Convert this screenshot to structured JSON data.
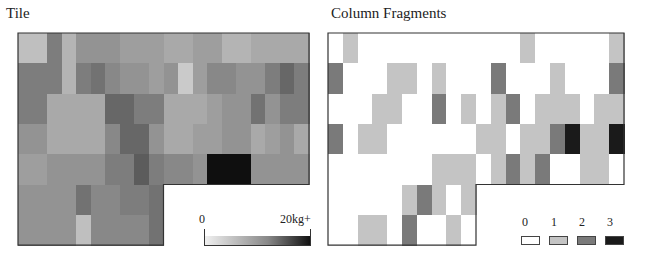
{
  "left_title": "Tile",
  "right_title": "Column Fragments",
  "left_legend": {
    "min_label": "0",
    "max_label": "20kg+"
  },
  "right_legend": {
    "labels": [
      "0",
      "1",
      "2",
      "3"
    ],
    "colors": [
      "#ffffff",
      "#c4c4c4",
      "#7a7a7a",
      "#1a1a1a"
    ]
  },
  "chart_data": [
    {
      "type": "heatmap",
      "title": "Tile",
      "shape": "L-shaped grid: 20 columns x 7 rows; rows 6-7 only columns 0-9",
      "colorbar": {
        "min": 0,
        "max": 20,
        "min_label": "0",
        "max_label": "20kg+",
        "colormap": "white-to-black"
      },
      "rows": [
        [
          4,
          4,
          10,
          5,
          8,
          8,
          8,
          7,
          7,
          7,
          6,
          6,
          7,
          7,
          5,
          5,
          6,
          6,
          6,
          6
        ],
        [
          10,
          10,
          10,
          5,
          10,
          11,
          9,
          8,
          8,
          7,
          8,
          3,
          7,
          9,
          9,
          8,
          8,
          10,
          12,
          10
        ],
        [
          10,
          10,
          6,
          6,
          6,
          6,
          12,
          12,
          10,
          10,
          6,
          6,
          6,
          7,
          8,
          8,
          11,
          8,
          10,
          10
        ],
        [
          8,
          8,
          6,
          6,
          6,
          6,
          9,
          12,
          12,
          8,
          6,
          6,
          7,
          7,
          8,
          8,
          6,
          7,
          8,
          6
        ],
        [
          7,
          7,
          8,
          8,
          8,
          8,
          10,
          10,
          13,
          10,
          9,
          9,
          8,
          20,
          20,
          20,
          8,
          8,
          8,
          8
        ],
        [
          8,
          8,
          8,
          8,
          11,
          9,
          9,
          10,
          10,
          11
        ],
        [
          8,
          8,
          8,
          8,
          4,
          9,
          9,
          9,
          9,
          11
        ]
      ]
    },
    {
      "type": "heatmap",
      "title": "Column Fragments",
      "shape": "L-shaped grid: 20 columns x 7 rows; rows 6-7 only columns 0-9",
      "legend": {
        "categories": [
          0,
          1,
          2,
          3
        ],
        "labels": [
          "0",
          "1",
          "2",
          "3"
        ]
      },
      "rows": [
        [
          0,
          1,
          0,
          0,
          0,
          0,
          0,
          0,
          0,
          0,
          0,
          0,
          0,
          1,
          0,
          0,
          0,
          0,
          0,
          1
        ],
        [
          2,
          0,
          0,
          0,
          1,
          1,
          0,
          1,
          0,
          0,
          0,
          2,
          0,
          0,
          0,
          1,
          0,
          0,
          0,
          2
        ],
        [
          0,
          0,
          0,
          1,
          1,
          0,
          0,
          2,
          0,
          1,
          0,
          1,
          2,
          0,
          1,
          1,
          1,
          0,
          1,
          1
        ],
        [
          2,
          0,
          1,
          1,
          0,
          0,
          0,
          0,
          0,
          0,
          1,
          1,
          0,
          1,
          1,
          2,
          3,
          1,
          1,
          3
        ],
        [
          0,
          0,
          0,
          0,
          0,
          0,
          0,
          1,
          1,
          1,
          0,
          1,
          2,
          1,
          2,
          0,
          0,
          1,
          1,
          0
        ],
        [
          0,
          0,
          0,
          0,
          0,
          1,
          2,
          1,
          0,
          1
        ],
        [
          0,
          0,
          1,
          1,
          0,
          2,
          0,
          0,
          1,
          0
        ]
      ]
    }
  ]
}
